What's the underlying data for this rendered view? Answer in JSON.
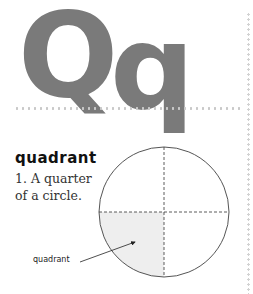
{
  "page": {
    "letter_upper": "Q",
    "letter_lower": "q",
    "headword": "quadrant",
    "definition": "1. A quarter of a circle."
  },
  "diagram": {
    "type": "circle divided into four quadrants by dashed lines",
    "shaded_quadrant": "bottom-left",
    "label": "quadrant",
    "colors": {
      "letter": "#7a7a7a",
      "circle_stroke": "#555555",
      "shade": "#eeeeee",
      "dashed_lines": "#333333"
    }
  }
}
